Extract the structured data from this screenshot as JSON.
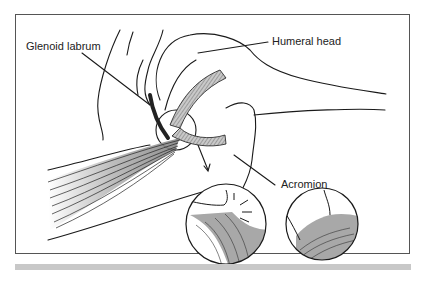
{
  "figure": {
    "labels": {
      "glenoid_labrum": "Glenoid labrum",
      "humeral_head": "Humeral head",
      "acromion": "Acromion"
    },
    "insets": [
      {
        "name": "torn-labrum-inset"
      },
      {
        "name": "normal-labrum-inset"
      }
    ],
    "colors": {
      "line": "#1a1a1a",
      "muscle_fill": "#9a9a9a",
      "cartilage_fill": "#b5b5b5",
      "frame_border": "#555555",
      "bottom_bar": "#c8c8c8"
    }
  }
}
